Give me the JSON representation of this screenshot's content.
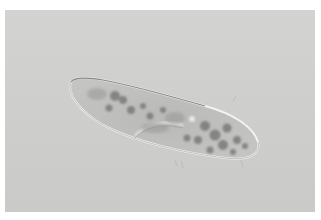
{
  "image": {
    "subject": "paramecium",
    "description": "Light microscope photograph of a single-celled paramecium on a gray background",
    "colors": {
      "background": "#cfcfcd",
      "border": "#ffffff",
      "cell_body": "#bdbdbb",
      "cell_outline": "#f4f4f2",
      "vacuoles": "#6e6e6c"
    }
  }
}
